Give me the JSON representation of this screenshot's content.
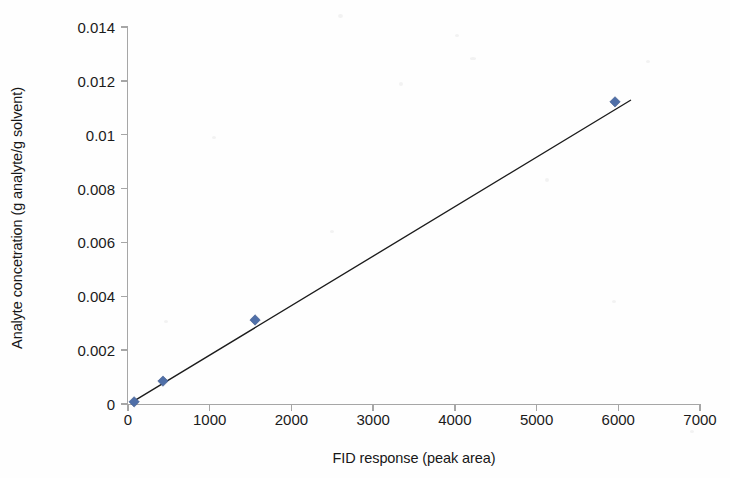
{
  "chart_data": {
    "type": "scatter",
    "title": "",
    "xlabel": "FID response (peak area)",
    "ylabel": "Analyte concetration (g analyte/g solvent)",
    "xlim": [
      0,
      7000
    ],
    "ylim": [
      0,
      0.014
    ],
    "xticks": [
      0,
      1000,
      2000,
      3000,
      4000,
      5000,
      6000,
      7000
    ],
    "xtick_labels": [
      "0",
      "1000",
      "2000",
      "3000",
      "4000",
      "5000",
      "6000",
      "7000"
    ],
    "yticks": [
      0,
      0.002,
      0.004,
      0.006,
      0.008,
      0.01,
      0.012,
      0.014
    ],
    "ytick_labels": [
      "0",
      "0.002",
      "0.004",
      "0.006",
      "0.008",
      "0.01",
      "0.012",
      "0.014"
    ],
    "grid": false,
    "legend": false,
    "legend_position": "none",
    "series": [
      {
        "name": "Calibration points",
        "marker": "diamond",
        "color": "#4f6fa8",
        "x": [
          75,
          428,
          1555,
          5960
        ],
        "y": [
          8e-05,
          0.00085,
          0.00312,
          0.01122
        ]
      },
      {
        "name": "Linear trendline",
        "type": "line",
        "color": "#1c1c1c",
        "x": [
          40,
          6150
        ],
        "y": [
          5e-05,
          0.01128
        ]
      }
    ]
  },
  "axes": {
    "x_title": "FID response (peak area)",
    "y_title": "Analyte concetration (g analyte/g solvent)"
  },
  "colors": {
    "marker": "#4f6fa8",
    "marker_edge": "#40598a",
    "trendline": "#1c1c1c",
    "axis": "#a6a6a6",
    "background": "#fefefe",
    "text": "#1b1b1b"
  }
}
